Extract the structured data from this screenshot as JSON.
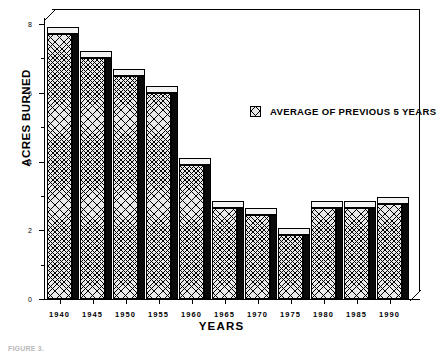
{
  "chart_data": {
    "type": "bar",
    "title": "",
    "subtitle": "",
    "xlabel": "YEARS",
    "ylabel": "ACRES BURNED",
    "categories": [
      "1940",
      "1945",
      "1950",
      "1955",
      "1960",
      "1965",
      "1970",
      "1975",
      "1980",
      "1985",
      "1990"
    ],
    "values": [
      7.7,
      7.0,
      6.5,
      6.0,
      3.9,
      2.65,
      2.45,
      1.85,
      2.65,
      2.65,
      2.75
    ],
    "series": [
      {
        "name": "AVERAGE OF PREVIOUS 5 YEARS",
        "values": [
          7.7,
          7.0,
          6.5,
          6.0,
          3.9,
          2.65,
          2.45,
          1.85,
          2.65,
          2.65,
          2.75
        ]
      }
    ],
    "ylim": [
      0,
      8
    ],
    "yticks": [
      0,
      2,
      4,
      6,
      8
    ],
    "ytick_labels": [
      "0",
      "2",
      "4",
      "6",
      "8"
    ],
    "yminor_ticks": [
      1,
      3,
      5,
      7
    ],
    "xlim_labels": [
      "1940",
      "1990"
    ],
    "grid": false,
    "legend": {
      "position": "inside-upper-right",
      "entries": [
        {
          "label": "AVERAGE OF PREVIOUS 5 YEARS",
          "swatch": "crosshatch-pattern-swatch"
        }
      ]
    },
    "style": {
      "bar_style": "3d-extruded",
      "bar_fill": "#e9e9e9",
      "bar_pattern": "crosshatch",
      "bar_side_color": "#0a0a0a",
      "bar_top_color": "#f3f3f3",
      "outline_color": "#000000",
      "background": "#ffffff"
    }
  },
  "caption": {
    "text": "FIGURE 3."
  }
}
